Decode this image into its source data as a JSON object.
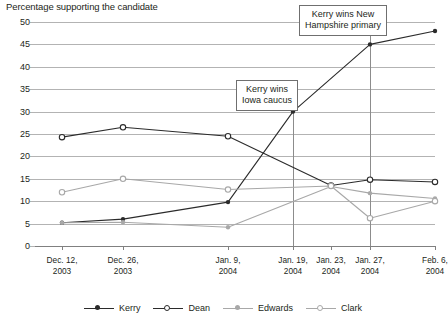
{
  "chart_data": {
    "type": "line",
    "title": "Percentage supporting the candidate",
    "xlabel": "",
    "ylabel": "",
    "ylim": [
      0,
      50
    ],
    "ytick_step": 5,
    "yticks": [
      "0",
      "5",
      "10",
      "15",
      "20",
      "25",
      "30",
      "35",
      "40",
      "45",
      "50"
    ],
    "grid": true,
    "legend_position": "bottom",
    "categories": [
      "Dec. 12, 2003",
      "Dec. 26, 2003",
      "Jan. 9, 2004",
      "Jan. 19, 2004",
      "Jan. 23, 2004",
      "Jan. 27, 2004",
      "Feb. 6, 2004"
    ],
    "category_lines": [
      [
        "Dec. 12,",
        "2003"
      ],
      [
        "Dec. 26,",
        "2003"
      ],
      [
        "Jan. 9,",
        "2004"
      ],
      [
        "Jan. 19,",
        "2004"
      ],
      [
        "Jan. 23,",
        "2004"
      ],
      [
        "Jan. 27,",
        "2004"
      ],
      [
        "Feb. 6,",
        "2004"
      ]
    ],
    "x_positions_pct": [
      6.75,
      22.0,
      48.25,
      64.5,
      74.0,
      83.75,
      100.0
    ],
    "series": [
      {
        "name": "Kerry",
        "color": "#2b2b2b",
        "marker": "filled-circle",
        "values": [
          5.2,
          6.0,
          9.8,
          30.0,
          45.0,
          45.0,
          48.0
        ],
        "points": [
          {
            "x": "Dec. 12, 2003",
            "y": 5.2
          },
          {
            "x": "Dec. 26, 2003",
            "y": 6.0
          },
          {
            "x": "Jan. 9, 2004",
            "y": 9.8
          },
          {
            "x": "Jan. 19, 2004",
            "y": 30.0
          },
          {
            "x": "Jan. 27, 2004",
            "y": 45.0
          },
          {
            "x": "Feb. 6, 2004",
            "y": 48.0
          }
        ]
      },
      {
        "name": "Dean",
        "color": "#2b2b2b",
        "marker": "open-circle",
        "values": [
          24.3,
          26.5,
          24.5,
          13.3,
          13.5,
          14.8,
          14.3
        ],
        "points": [
          {
            "x": "Dec. 12, 2003",
            "y": 24.3
          },
          {
            "x": "Dec. 26, 2003",
            "y": 26.5
          },
          {
            "x": "Jan. 9, 2004",
            "y": 24.5
          },
          {
            "x": "Jan. 23, 2004",
            "y": 13.5
          },
          {
            "x": "Jan. 27, 2004",
            "y": 14.8
          },
          {
            "x": "Feb. 6, 2004",
            "y": 14.3
          }
        ]
      },
      {
        "name": "Edwards",
        "color": "#a8a8a8",
        "marker": "filled-circle",
        "values": [
          5.2,
          5.3,
          4.2,
          13.2,
          13.3,
          11.8,
          10.6
        ],
        "points": [
          {
            "x": "Dec. 12, 2003",
            "y": 5.2
          },
          {
            "x": "Dec. 26, 2003",
            "y": 5.3
          },
          {
            "x": "Jan. 9, 2004",
            "y": 4.2
          },
          {
            "x": "Jan. 23, 2004",
            "y": 13.3
          },
          {
            "x": "Jan. 27, 2004",
            "y": 11.8
          },
          {
            "x": "Feb. 6, 2004",
            "y": 10.6
          }
        ]
      },
      {
        "name": "Clark",
        "color": "#a8a8a8",
        "marker": "open-circle",
        "values": [
          12.0,
          15.0,
          12.6,
          13.4,
          13.4,
          6.2,
          10.0
        ],
        "points": [
          {
            "x": "Dec. 12, 2003",
            "y": 12.0
          },
          {
            "x": "Dec. 26, 2003",
            "y": 15.0
          },
          {
            "x": "Jan. 9, 2004",
            "y": 12.6
          },
          {
            "x": "Jan. 23, 2004",
            "y": 13.4
          },
          {
            "x": "Jan. 27, 2004",
            "y": 6.2
          },
          {
            "x": "Feb. 6, 2004",
            "y": 10.0
          }
        ]
      }
    ],
    "annotations": [
      {
        "id": "iowa",
        "lines": [
          "Kerry wins",
          "Iowa caucus"
        ],
        "at_category": "Jan. 19, 2004"
      },
      {
        "id": "new-hampshire",
        "lines": [
          "Kerry wins New",
          "Hampshire primary"
        ],
        "at_category": "Jan. 27, 2004"
      }
    ]
  },
  "legend": {
    "items": [
      {
        "label": "Kerry"
      },
      {
        "label": "Dean"
      },
      {
        "label": "Edwards"
      },
      {
        "label": "Clark"
      }
    ]
  }
}
